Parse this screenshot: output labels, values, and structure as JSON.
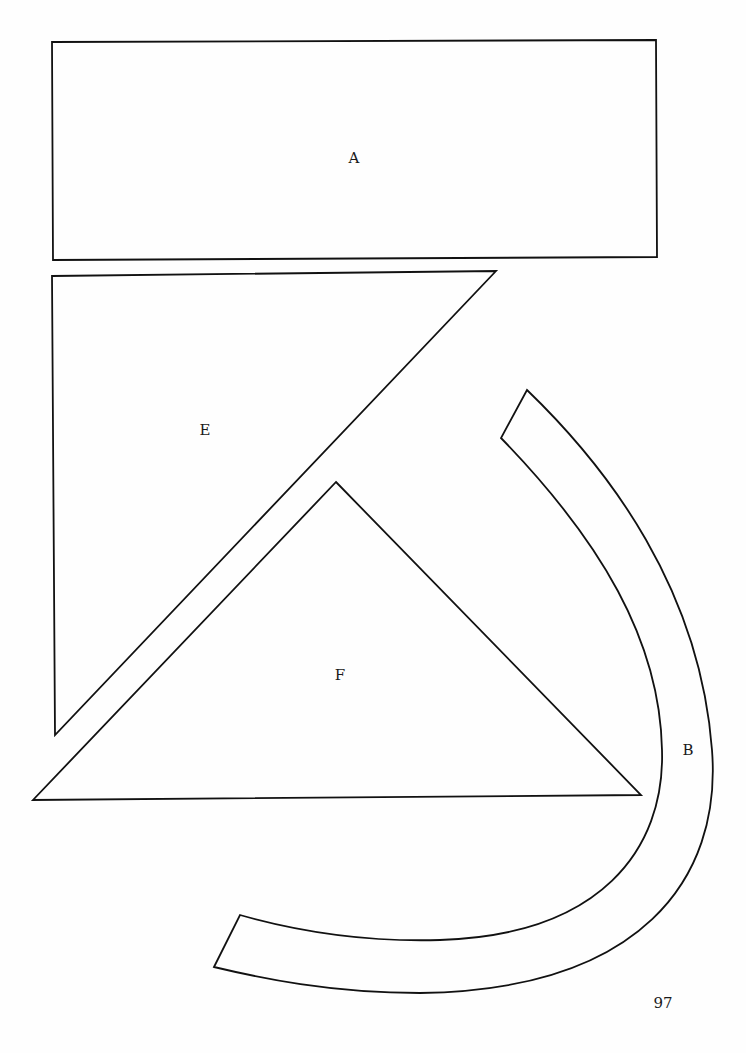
{
  "page": {
    "page_number": "97",
    "background": "#ffffff",
    "stroke_color": "#111111"
  },
  "shapes": [
    {
      "id": "A",
      "label": "A",
      "type": "rectangle"
    },
    {
      "id": "E",
      "label": "E",
      "type": "right-triangle"
    },
    {
      "id": "F",
      "label": "F",
      "type": "triangle"
    },
    {
      "id": "B",
      "label": "B",
      "type": "curved-band"
    }
  ]
}
